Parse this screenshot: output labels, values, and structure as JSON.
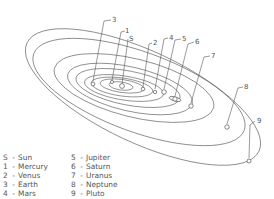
{
  "diagram": {
    "type": "solar-system-orbits",
    "colors": {
      "line": "#555555",
      "background": "#ffffff"
    },
    "callouts": [
      {
        "key": "3",
        "x": 113,
        "y": 21
      },
      {
        "key": "1",
        "x": 126,
        "y": 32
      },
      {
        "key": "S",
        "x": 129,
        "y": 40
      },
      {
        "key": "2",
        "x": 153,
        "y": 43
      },
      {
        "key": "4",
        "x": 169,
        "y": 39
      },
      {
        "key": "5",
        "x": 182,
        "y": 40
      },
      {
        "key": "6",
        "x": 195,
        "y": 43
      },
      {
        "key": "7",
        "x": 211,
        "y": 57
      },
      {
        "key": "8",
        "x": 244,
        "y": 88
      },
      {
        "key": "9",
        "x": 257,
        "y": 121
      }
    ]
  },
  "legend": {
    "separator": "-",
    "column1": [
      {
        "key": "S",
        "name": "Sun"
      },
      {
        "key": "1",
        "name": "Mercury"
      },
      {
        "key": "2",
        "name": "Venus"
      },
      {
        "key": "3",
        "name": "Earth"
      },
      {
        "key": "4",
        "name": "Mars"
      }
    ],
    "column2": [
      {
        "key": "5",
        "name": "Jupiter"
      },
      {
        "key": "6",
        "name": "Saturn"
      },
      {
        "key": "7",
        "name": "Uranus"
      },
      {
        "key": "8",
        "name": "Neptune"
      },
      {
        "key": "9",
        "name": "Pluto"
      }
    ]
  }
}
